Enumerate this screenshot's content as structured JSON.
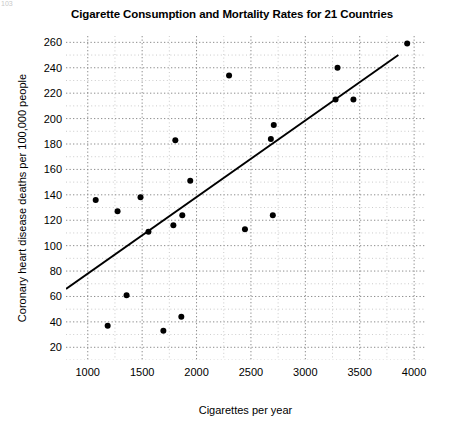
{
  "figure": {
    "title": "Cigarette Consumption and Mortality Rates for 21 Countries",
    "page_artifact": "103"
  },
  "chart_data": {
    "type": "scatter",
    "title": "Cigarette Consumption and Mortality Rates for 21 Countries",
    "xlabel": "Cigarettes per year",
    "ylabel": "Coronary heart disease deaths per 100,000 people",
    "xlim": [
      800,
      4100
    ],
    "ylim": [
      10,
      265
    ],
    "xticks": [
      1000,
      1500,
      2000,
      2500,
      3000,
      3500,
      4000
    ],
    "yticks": [
      20,
      40,
      60,
      80,
      100,
      120,
      140,
      160,
      180,
      200,
      220,
      240,
      260
    ],
    "xtick_labels": [
      "1000",
      "1500",
      "2000",
      "2500",
      "3000",
      "3500",
      "4000"
    ],
    "ytick_labels": [
      "20",
      "40",
      "60",
      "80",
      "100",
      "120",
      "140",
      "160",
      "180",
      "200",
      "220",
      "240",
      "260"
    ],
    "grid": true,
    "grid_style": "dotted",
    "grid_minor": true,
    "grid_color": "#b4b4b4",
    "legend": null,
    "marker_color": "#000000",
    "marker_size": 6,
    "line_color": "#000000",
    "n_points": 21,
    "points": [
      {
        "x": 1073,
        "y": 136
      },
      {
        "x": 1183,
        "y": 37
      },
      {
        "x": 1274,
        "y": 127
      },
      {
        "x": 1357,
        "y": 61
      },
      {
        "x": 1485,
        "y": 138
      },
      {
        "x": 1558,
        "y": 111
      },
      {
        "x": 1695,
        "y": 33
      },
      {
        "x": 1787,
        "y": 116
      },
      {
        "x": 1805,
        "y": 183
      },
      {
        "x": 1860,
        "y": 44
      },
      {
        "x": 1869,
        "y": 124
      },
      {
        "x": 1942,
        "y": 151
      },
      {
        "x": 2299,
        "y": 234
      },
      {
        "x": 2445,
        "y": 113
      },
      {
        "x": 2683,
        "y": 184
      },
      {
        "x": 2701,
        "y": 124
      },
      {
        "x": 2710,
        "y": 195
      },
      {
        "x": 3278,
        "y": 215
      },
      {
        "x": 3296,
        "y": 240
      },
      {
        "x": 3442,
        "y": 215
      },
      {
        "x": 3936,
        "y": 259
      }
    ],
    "trendline": {
      "type": "linear-fit",
      "x_start": 800,
      "y_start": 66,
      "x_end": 3855,
      "y_end": 250
    }
  }
}
